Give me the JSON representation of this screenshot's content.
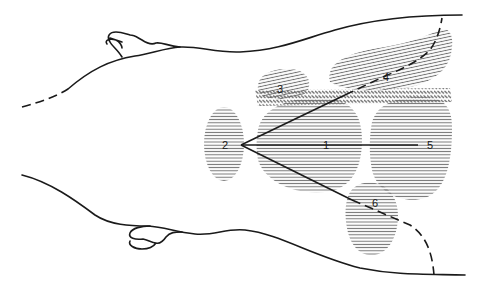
{
  "diagram": {
    "title": "",
    "colors": {
      "line": "#1a1a1a",
      "hatch": "#6e6e6e",
      "background": "#ffffff"
    },
    "labels": {
      "l1": "1",
      "l2": "2",
      "l3": "3",
      "l4": "4",
      "l5": "5",
      "l6": "6"
    },
    "regions": [
      {
        "id": "1",
        "label": "1",
        "pattern": "horizontal-hatch"
      },
      {
        "id": "2",
        "label": "2",
        "pattern": "horizontal-hatch"
      },
      {
        "id": "3",
        "label": "3",
        "pattern": "diagonal-hatch"
      },
      {
        "id": "4",
        "label": "4",
        "pattern": "diagonal-hatch"
      },
      {
        "id": "5",
        "label": "5",
        "pattern": "horizontal-hatch"
      },
      {
        "id": "6",
        "label": "6",
        "pattern": "horizontal-hatch"
      },
      {
        "id": "band",
        "label": "",
        "pattern": "zigzag-hatch"
      }
    ],
    "lines": [
      {
        "from": "2",
        "to": "1",
        "style": "solid"
      },
      {
        "from": "1",
        "to": "5",
        "style": "solid"
      },
      {
        "from": "2",
        "to": "4",
        "style": "solid-then-dashed"
      },
      {
        "from": "2",
        "to": "6",
        "style": "solid-then-dashed"
      }
    ]
  }
}
